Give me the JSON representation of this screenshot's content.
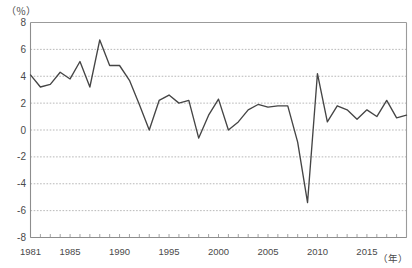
{
  "chart_data": {
    "type": "line",
    "title": "",
    "subtitle": "",
    "xlabel": "（年）",
    "ylabel": "（％）",
    "ylim": [
      -8,
      8
    ],
    "xlim": [
      1981,
      2019
    ],
    "y_ticks": [
      8,
      6,
      4,
      2,
      0,
      -2,
      -4,
      -6,
      -8
    ],
    "y_tick_labels": [
      "8",
      "6",
      "4",
      "2",
      "0",
      "-2",
      "-4",
      "-6",
      "-8"
    ],
    "x_tick_labels": [
      "1981",
      "1985",
      "1990",
      "1995",
      "2000",
      "2005",
      "2010",
      "2015"
    ],
    "x_tick_values": [
      1981,
      1985,
      1990,
      1995,
      2000,
      2005,
      2010,
      2015
    ],
    "x_minor_tick_interval": 1,
    "grid": "horizontal-dashed",
    "legend": "none",
    "legend_position": "none",
    "series": [
      {
        "name": "growth-rate",
        "color": "#454545",
        "x": [
          1981,
          1982,
          1983,
          1984,
          1985,
          1986,
          1987,
          1988,
          1989,
          1990,
          1991,
          1992,
          1993,
          1994,
          1995,
          1996,
          1997,
          1998,
          1999,
          2000,
          2001,
          2002,
          2003,
          2004,
          2005,
          2006,
          2007,
          2008,
          2009,
          2010,
          2011,
          2012,
          2013,
          2014,
          2015,
          2016,
          2017,
          2018,
          2019
        ],
        "values": [
          4.1,
          3.2,
          3.4,
          4.3,
          3.8,
          5.1,
          3.2,
          6.7,
          4.8,
          4.8,
          3.7,
          1.9,
          0.0,
          2.2,
          2.6,
          2.0,
          2.2,
          -0.6,
          1.1,
          2.3,
          0.0,
          0.6,
          1.5,
          1.9,
          1.7,
          1.8,
          1.8,
          -0.9,
          -5.4,
          4.2,
          0.6,
          1.8,
          1.5,
          0.8,
          1.5,
          1.0,
          2.2,
          0.9,
          1.1
        ]
      }
    ]
  },
  "axis": {
    "unit_y": "（％）",
    "unit_x": "（年）"
  }
}
